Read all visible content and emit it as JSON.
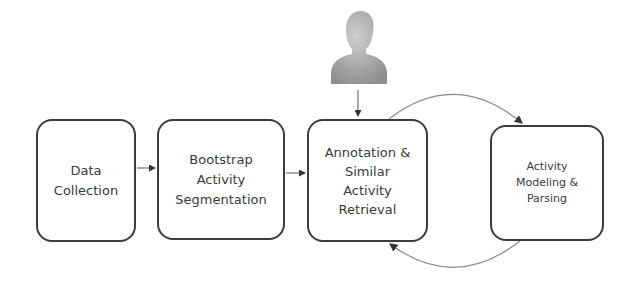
{
  "diagram": {
    "nodes": [
      {
        "id": "data-collection",
        "label": "Data\nCollection"
      },
      {
        "id": "bootstrap-segmentation",
        "label": "Bootstrap\nActivity\nSegmentation"
      },
      {
        "id": "annotation-retrieval",
        "label": "Annotation &\nSimilar\nActivity\nRetrieval"
      },
      {
        "id": "modeling-parsing",
        "label": "Activity\nModeling &\nParsing"
      }
    ],
    "actor": {
      "icon": "person-icon"
    },
    "edges": [
      {
        "from": "data-collection",
        "to": "bootstrap-segmentation",
        "style": "straight"
      },
      {
        "from": "bootstrap-segmentation",
        "to": "annotation-retrieval",
        "style": "straight"
      },
      {
        "from": "actor",
        "to": "annotation-retrieval",
        "style": "straight"
      },
      {
        "from": "annotation-retrieval",
        "to": "modeling-parsing",
        "style": "arc-top"
      },
      {
        "from": "modeling-parsing",
        "to": "annotation-retrieval",
        "style": "arc-bottom"
      }
    ],
    "colors": {
      "box_border": "#3c3c3c",
      "arrow": "#555555",
      "arc": "#8a8a8a",
      "person": "#a8a8a8"
    }
  }
}
